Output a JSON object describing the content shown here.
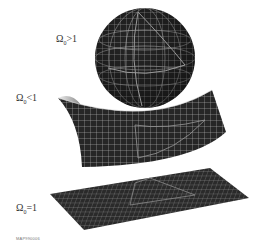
{
  "labels": {
    "closed": {
      "symbol": "Ω",
      "sub": "0",
      "rel": ">1"
    },
    "open": {
      "symbol": "Ω",
      "sub": "0",
      "rel": "<1"
    },
    "flat": {
      "symbol": "Ω",
      "sub": "0",
      "rel": "=1"
    }
  },
  "credit": "MAP990006",
  "colors": {
    "surface": "#2a2a2a",
    "grid": "#bcbcbc",
    "triangle": "#8a8a8a"
  }
}
